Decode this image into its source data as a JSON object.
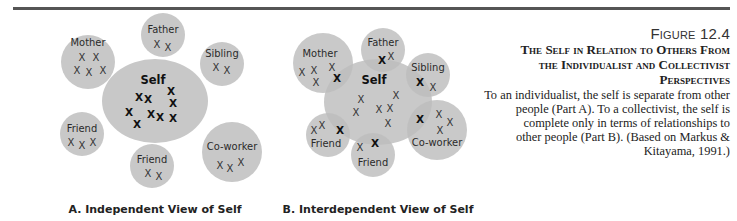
{
  "figure": {
    "number": "Figure 12.4",
    "title_lines": [
      "The Self in Relation to Others From",
      "the Individualist and Collectivist",
      "Perspectives"
    ],
    "description_lines": [
      "To an individualist, the self is separate from other",
      "people (Part A). To a collectivist, the self is",
      "complete only in terms of relationships to",
      "other people (Part B). (Based on Markus &",
      "Kitayama, 1991.)"
    ]
  },
  "colors": {
    "circle_fill": "#c8c8c8",
    "overlap_fill": "#a8a8a8",
    "rule": "#555555"
  },
  "part_a": {
    "caption": "A. Independent View of Self",
    "self": {
      "label": "Self"
    },
    "others": {
      "mother": "Mother",
      "father": "Father",
      "sibling": "Sibling",
      "friend_left": "Friend",
      "friend_bottom": "Friend",
      "coworker": "Co-worker"
    },
    "mark": "X"
  },
  "part_b": {
    "caption": "B. Interdependent View of Self",
    "self": {
      "label": "Self"
    },
    "others": {
      "mother": "Mother",
      "father": "Father",
      "sibling": "Sibling",
      "friend_left": "Friend",
      "friend_bottom": "Friend",
      "coworker": "Co-worker"
    },
    "mark": "X"
  }
}
